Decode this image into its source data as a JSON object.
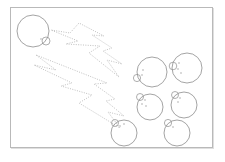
{
  "figure": {
    "title": "",
    "caption": "",
    "background_color": "#ffffff",
    "frame": {
      "x": 10,
      "y": 7,
      "width": 203,
      "height": 141,
      "border_color": "#b9b9b9",
      "border_width": 1,
      "shadow_color": "#969696"
    },
    "stroke_color": "#8d8d8d",
    "bolt_color": "#b0b0b0",
    "dot_color": "#9a9a9a"
  },
  "cells": [
    {
      "id": "cell-top-left",
      "label": "budding-cell-top-left",
      "cx": 33,
      "cy": 31,
      "r": 16,
      "bud": {
        "cx": 46,
        "cy": 41,
        "r": 4.0
      },
      "dots": [
        {
          "cx": 41,
          "cy": 39,
          "r": 0.7
        }
      ]
    },
    {
      "id": "cell-right-upper-left",
      "label": "budding-cell-right-upper-left",
      "cx": 152,
      "cy": 72,
      "r": 15,
      "bud": {
        "cx": 137,
        "cy": 78,
        "r": 3.6
      },
      "dots": [
        {
          "cx": 143,
          "cy": 70,
          "r": 0.7
        },
        {
          "cx": 142,
          "cy": 75,
          "r": 0.7
        }
      ]
    },
    {
      "id": "cell-right-upper-right",
      "label": "budding-cell-right-upper-right",
      "cx": 187,
      "cy": 68,
      "r": 15,
      "bud": {
        "cx": 173,
        "cy": 66,
        "r": 3.8
      },
      "dots": [
        {
          "cx": 179,
          "cy": 63,
          "r": 0.7
        },
        {
          "cx": 178,
          "cy": 69,
          "r": 0.7
        },
        {
          "cx": 181,
          "cy": 73,
          "r": 0.7
        }
      ]
    },
    {
      "id": "cell-right-middle-left",
      "label": "budding-cell-right-middle-left",
      "cx": 150,
      "cy": 107,
      "r": 13,
      "bud": {
        "cx": 140,
        "cy": 97,
        "r": 3.5
      },
      "dots": [
        {
          "cx": 145,
          "cy": 100,
          "r": 0.7
        },
        {
          "cx": 142,
          "cy": 104,
          "r": 0.7
        },
        {
          "cx": 146,
          "cy": 106,
          "r": 0.7
        }
      ]
    },
    {
      "id": "cell-right-middle-right",
      "label": "budding-cell-right-middle-right",
      "cx": 184,
      "cy": 105,
      "r": 13,
      "bud": {
        "cx": 175,
        "cy": 95,
        "r": 3.5
      },
      "dots": [
        {
          "cx": 180,
          "cy": 98,
          "r": 0.7
        },
        {
          "cx": 178,
          "cy": 102,
          "r": 0.7
        }
      ]
    },
    {
      "id": "cell-bottom-left",
      "label": "budding-cell-bottom-left",
      "cx": 124,
      "cy": 133,
      "r": 13,
      "bud": {
        "cx": 115,
        "cy": 123,
        "r": 3.5
      },
      "dots": [
        {
          "cx": 120,
          "cy": 126,
          "r": 0.7
        },
        {
          "cx": 124,
          "cy": 124,
          "r": 0.7
        }
      ]
    },
    {
      "id": "cell-bottom-right",
      "label": "budding-cell-bottom-right",
      "cx": 177,
      "cy": 133,
      "r": 13,
      "bud": {
        "cx": 168,
        "cy": 123,
        "r": 3.6
      },
      "dots": [
        {
          "cx": 173,
          "cy": 127,
          "r": 0.7
        }
      ]
    }
  ],
  "bolts": [
    {
      "id": "bolt-upper",
      "label": "dotted-lightning-arrow-upper",
      "points": "79,23 70,33 51,30 78,41 66,44 100,46 89,53 119,77 107,60 122,64 103,51 112,48 92,35 104,36"
    },
    {
      "id": "bolt-lower",
      "label": "dotted-lightning-arrow-lower",
      "points": "36,55 56,70 34,65 72,83 61,86 92,95 79,103 120,128 108,112 124,116 106,101 115,99 94,84 107,83"
    }
  ]
}
